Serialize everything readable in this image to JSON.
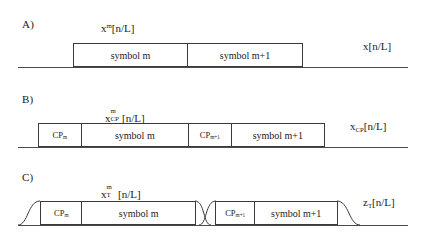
{
  "figure": {
    "panels": [
      {
        "letter": "A)",
        "top_label": {
          "base": "x",
          "sup": "m",
          "tail": "[n/L]"
        },
        "right_label": {
          "base": "x",
          "sub": "",
          "tail": "[n/L]"
        },
        "blocks": [
          {
            "kind": "symbol",
            "label": "symbol m"
          },
          {
            "kind": "symbol",
            "label": "symbol m+1"
          }
        ]
      },
      {
        "letter": "B)",
        "top_label": {
          "base": "x",
          "sub": "CP",
          "sup": "m",
          "tail": "[n/L]"
        },
        "right_label": {
          "base": "x",
          "sub": "CP",
          "tail": "[n/L]"
        },
        "blocks": [
          {
            "kind": "cp",
            "label": "CP",
            "sub": "m"
          },
          {
            "kind": "symbol",
            "label": "symbol m"
          },
          {
            "kind": "cp",
            "label": "CP",
            "sub": "m+1"
          },
          {
            "kind": "symbol",
            "label": "symbol m+1"
          }
        ]
      },
      {
        "letter": "C)",
        "top_label": {
          "base": "x",
          "sub": "T",
          "sup": "m",
          "tail": "[n/L]"
        },
        "right_label": {
          "base": "z",
          "sub": "T",
          "tail": "[n/L]"
        },
        "blocks": [
          {
            "kind": "cp",
            "label": "CP",
            "sub": "m"
          },
          {
            "kind": "symbol",
            "label": "symbol m"
          },
          {
            "kind": "cp",
            "label": "CP",
            "sub": "m+1"
          },
          {
            "kind": "symbol",
            "label": "symbol m+1"
          }
        ]
      }
    ]
  },
  "colors": {
    "line": "#3a3a3a",
    "baseline": "#4a4a4a",
    "background": "#ffffff",
    "text": "#1a1a1a"
  }
}
